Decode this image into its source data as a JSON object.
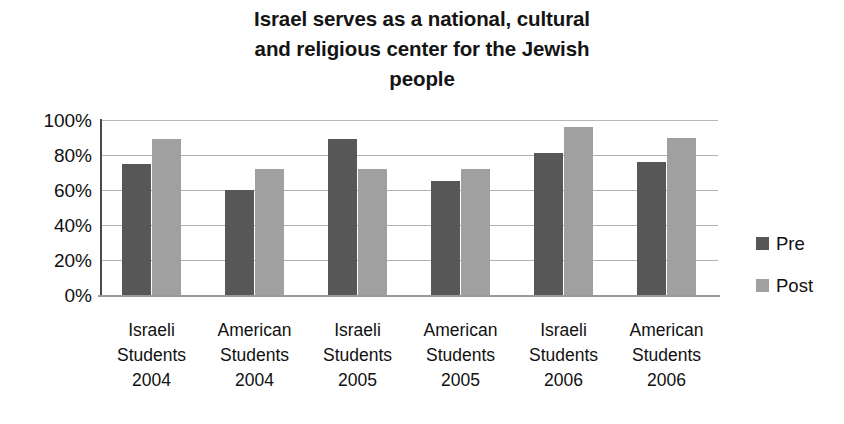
{
  "chart_data": {
    "type": "bar",
    "title": "Israel serves as a national, cultural and religious center for the Jewish people",
    "title_lines": [
      "Israel serves as a national, cultural",
      "and religious center for the Jewish",
      "people"
    ],
    "xlabel": "",
    "ylabel": "",
    "ylim": [
      0,
      100
    ],
    "ytick_labels": [
      "100%",
      "80%",
      "60%",
      "40%",
      "20%",
      "0%"
    ],
    "ytick_values": [
      100,
      80,
      60,
      40,
      20,
      0
    ],
    "grid": true,
    "legend_position": "right",
    "categories": [
      "Israeli Students 2004",
      "American Students 2004",
      "Israeli Students 2005",
      "American Students 2005",
      "Israeli Students 2006",
      "American Students 2006"
    ],
    "category_lines": [
      [
        "Israeli",
        "Students",
        "2004"
      ],
      [
        "American",
        "Students",
        "2004"
      ],
      [
        "Israeli",
        "Students",
        "2005"
      ],
      [
        "American",
        "Students",
        "2005"
      ],
      [
        "Israeli",
        "Students",
        "2006"
      ],
      [
        "American",
        "Students",
        "2006"
      ]
    ],
    "series": [
      {
        "name": "Pre",
        "color": "#575757",
        "values": [
          75,
          60,
          89,
          65,
          81,
          76
        ]
      },
      {
        "name": "Post",
        "color": "#a0a0a0",
        "values": [
          89,
          72,
          72,
          72,
          96,
          90
        ]
      }
    ]
  },
  "legend": {
    "items": [
      {
        "label": "Pre"
      },
      {
        "label": "Post"
      }
    ]
  }
}
